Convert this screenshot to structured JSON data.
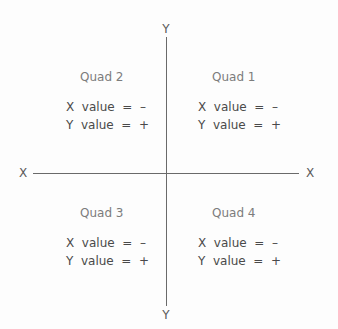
{
  "axes": {
    "y_top_label": "Y",
    "y_bottom_label": "Y",
    "x_left_label": "X",
    "x_right_label": "X",
    "line_color": "#6a6a6a"
  },
  "quadrants": {
    "quad2": {
      "title": "Quad 2",
      "x_value": "X  value  =  –",
      "y_value": "Y  value  =  +"
    },
    "quad1": {
      "title": "Quad 1",
      "x_value": "X  value  =  –",
      "y_value": "Y  value  =  +"
    },
    "quad3": {
      "title": "Quad 3",
      "x_value": "X  value  =  –",
      "y_value": "Y  value  =  +"
    },
    "quad4": {
      "title": "Quad 4",
      "x_value": "X  value  =  –",
      "y_value": "Y  value  =  +"
    }
  }
}
